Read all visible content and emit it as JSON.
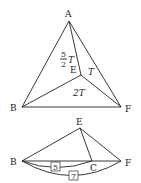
{
  "top_figure": {
    "points": {
      "A": "A",
      "B": "B",
      "E": "E",
      "F": "F"
    },
    "areas": {
      "ABE_num": "5",
      "ABE_den": "2",
      "ABE_var": "T",
      "AEF": "T",
      "BEF": "2T"
    }
  },
  "bottom_figure": {
    "points": {
      "B": "B",
      "C": "C",
      "E": "E",
      "F": "F"
    },
    "lengths": {
      "BC": "5",
      "BF": "7"
    }
  }
}
